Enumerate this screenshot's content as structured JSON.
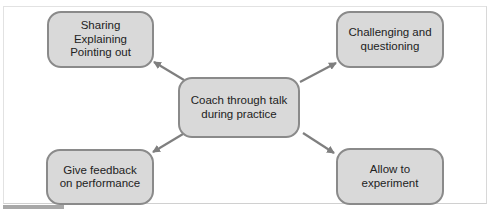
{
  "diagram": {
    "type": "hub-and-spoke",
    "center": {
      "label": "Coach through talk\nduring practice"
    },
    "nodes": [
      {
        "id": "sharing",
        "label": "Sharing\nExplaining\nPointing out",
        "position": "top-left"
      },
      {
        "id": "challenge",
        "label": "Challenging and\nquestioning",
        "position": "top-right"
      },
      {
        "id": "feedback",
        "label": "Give feedback\non performance",
        "position": "bottom-left"
      },
      {
        "id": "allow",
        "label": "Allow to experiment",
        "position": "bottom-right"
      }
    ],
    "edges": [
      {
        "from": "center",
        "to": "sharing"
      },
      {
        "from": "center",
        "to": "challenge"
      },
      {
        "from": "center",
        "to": "feedback"
      },
      {
        "from": "center",
        "to": "allow"
      }
    ],
    "colors": {
      "node_fill": "#d9d9d9",
      "node_border": "#8a8a8a",
      "arrow": "#7f7f7f",
      "text": "#222222"
    }
  }
}
